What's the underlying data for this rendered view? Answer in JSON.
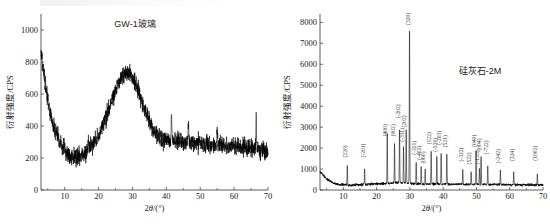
{
  "figure": {
    "name": "xrd-two-panel-figure",
    "panels": [
      "left",
      "right"
    ]
  },
  "chart_data": [
    {
      "id": "left",
      "type": "line",
      "title": "GW-1玻璃",
      "xlabel": "2θ/(°)",
      "ylabel": "衍射强度/CPS",
      "xlim": [
        3,
        70
      ],
      "ylim": [
        0,
        1100
      ],
      "xticks": [
        10,
        20,
        30,
        40,
        50,
        60,
        70
      ],
      "yticks": [
        0,
        200,
        400,
        600,
        800,
        1000
      ],
      "grid": false,
      "legend": "none",
      "series_name": "GW-1 glass XRD pattern",
      "notes": "Broad amorphous halo centred near 2θ = 28°; no sharp crystalline reflections.",
      "baseline_x": [
        3,
        4,
        5,
        6,
        7,
        8,
        9,
        10,
        11,
        12,
        13,
        14,
        15,
        16,
        17,
        18,
        19,
        20,
        21,
        22,
        23,
        24,
        25,
        26,
        27,
        28,
        29,
        30,
        31,
        32,
        33,
        34,
        35,
        36,
        37,
        38,
        39,
        40,
        41,
        42,
        43,
        44,
        45,
        46,
        47,
        48,
        49,
        50,
        51,
        52,
        53,
        54,
        55,
        56,
        57,
        58,
        59,
        60,
        61,
        62,
        63,
        64,
        65,
        66,
        67,
        68,
        69,
        70
      ],
      "baseline_y": [
        850,
        700,
        560,
        460,
        380,
        320,
        275,
        245,
        220,
        205,
        200,
        205,
        215,
        230,
        250,
        275,
        305,
        340,
        385,
        440,
        500,
        560,
        620,
        675,
        715,
        730,
        725,
        700,
        660,
        605,
        545,
        485,
        430,
        385,
        350,
        330,
        318,
        312,
        310,
        308,
        306,
        304,
        302,
        300,
        298,
        296,
        294,
        292,
        290,
        288,
        286,
        284,
        282,
        280,
        278,
        276,
        274,
        272,
        270,
        268,
        266,
        263,
        260,
        257,
        254,
        250,
        245,
        240
      ],
      "noise_amplitude_cps": 55,
      "spikes": [
        {
          "x": 17,
          "height": 70
        },
        {
          "x": 41.5,
          "height": 180
        },
        {
          "x": 46.5,
          "height": 95
        },
        {
          "x": 55,
          "height": 95
        },
        {
          "x": 66.5,
          "height": 200
        }
      ]
    },
    {
      "id": "right",
      "type": "line",
      "title": "硅灰石-2M",
      "xlabel": "2θ/(°)",
      "ylabel": "衍射强度/CPS",
      "xlim": [
        3,
        70
      ],
      "ylim": [
        0,
        8400
      ],
      "xticks": [
        10,
        20,
        30,
        40,
        50,
        60,
        70
      ],
      "yticks": [
        0,
        1000,
        2000,
        3000,
        4000,
        5000,
        6000,
        7000,
        8000
      ],
      "grid": false,
      "legend": "none",
      "series_name": "Wollastonite-2M XRD pattern",
      "notes": "Sharp crystalline reflections; strongest peak (320) at 2θ ≈ 30° reaching ~7400 CPS.",
      "baseline_x": [
        3,
        5,
        7,
        9,
        11,
        13,
        15,
        17,
        19,
        21,
        23,
        25,
        27,
        29,
        31,
        33,
        35,
        37,
        39,
        41,
        43,
        45,
        47,
        49,
        51,
        53,
        55,
        57,
        59,
        61,
        63,
        65,
        67,
        70
      ],
      "baseline_y": [
        880,
        520,
        330,
        260,
        240,
        235,
        250,
        270,
        290,
        300,
        320,
        340,
        350,
        330,
        300,
        290,
        285,
        285,
        280,
        280,
        275,
        275,
        270,
        270,
        265,
        265,
        260,
        255,
        255,
        250,
        250,
        245,
        245,
        240
      ],
      "noise_amplitude_cps": 60,
      "peaks": [
        {
          "hkl": "(220)",
          "two_theta": 11.2,
          "intensity": 900,
          "label_y": 1550
        },
        {
          "hkl": "(-201)",
          "two_theta": 16.4,
          "intensity": 760,
          "label_y": 1550
        },
        {
          "hkl": "(400)",
          "two_theta": 23.2,
          "intensity": 2320,
          "label_y": 2560
        },
        {
          "hkl": "(002)",
          "two_theta": 25.4,
          "intensity": 1900,
          "label_y": 2560
        },
        {
          "hkl": "(-202)",
          "two_theta": 26.9,
          "intensity": 2520,
          "label_y": 3420
        },
        {
          "hkl": "(202)",
          "two_theta": 28.9,
          "intensity": 2480,
          "label_y": 2980
        },
        {
          "hkl": "(-311)",
          "two_theta": 28.1,
          "intensity": 1720,
          "label_y": 2300
        },
        {
          "hkl": "(320)",
          "two_theta": 29.9,
          "intensity": 7400,
          "label_y": 7880
        },
        {
          "hkl": "(-321)",
          "two_theta": 31.9,
          "intensity": 1060,
          "label_y": 1680
        },
        {
          "hkl": "(-402)",
          "two_theta": 33.4,
          "intensity": 840,
          "label_y": 1440
        },
        {
          "hkl": "(060)",
          "two_theta": 34.6,
          "intensity": 700,
          "label_y": 1260
        },
        {
          "hkl": "(122)",
          "two_theta": 36.4,
          "intensity": 1570,
          "label_y": 2180
        },
        {
          "hkl": "(-520)",
          "two_theta": 38.1,
          "intensity": 1320,
          "label_y": 1820
        },
        {
          "hkl": "(-203)",
          "two_theta": 39.4,
          "intensity": 1520,
          "label_y": 2160
        },
        {
          "hkl": "(521)",
          "two_theta": 41.1,
          "intensity": 1480,
          "label_y": 2040
        },
        {
          "hkl": "(-322)",
          "two_theta": 45.9,
          "intensity": 700,
          "label_y": 1360
        },
        {
          "hkl": "(522)",
          "two_theta": 48.4,
          "intensity": 640,
          "label_y": 1220
        },
        {
          "hkl": "(040)",
          "two_theta": 49.9,
          "intensity": 1580,
          "label_y": 2060
        },
        {
          "hkl": "(-135)",
          "two_theta": 50.9,
          "intensity": 780,
          "label_y": 1220
        },
        {
          "hkl": "(004)",
          "two_theta": 51.4,
          "intensity": 1340,
          "label_y": 1880
        },
        {
          "hkl": "(-722)",
          "two_theta": 53.4,
          "intensity": 940,
          "label_y": 1700
        },
        {
          "hkl": "(-242)",
          "two_theta": 57.2,
          "intensity": 660,
          "label_y": 1280
        },
        {
          "hkl": "(324)",
          "two_theta": 61.2,
          "intensity": 620,
          "label_y": 1380
        },
        {
          "hkl": "(1002)",
          "two_theta": 68.3,
          "intensity": 560,
          "label_y": 1400
        }
      ]
    }
  ]
}
